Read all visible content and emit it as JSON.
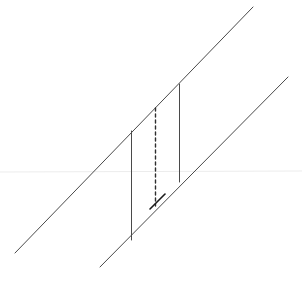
{
  "canvas": {
    "width": 302,
    "height": 286,
    "background_color": "#ffffff",
    "title": "Geometric line diagram"
  },
  "palette": {
    "stroke_dark": "#3a3a3a",
    "stroke_medium": "#555555",
    "stroke_faint": "#ececec",
    "background": "#ffffff"
  },
  "figure": {
    "horizon_line": {
      "name": "horizon-line",
      "x1": 0,
      "y1": 172,
      "x2": 302,
      "y2": 171,
      "color": "#ececec",
      "width": 1,
      "style": "solid"
    },
    "diagonals": [
      {
        "name": "upper-diagonal",
        "label": "Upper parallel line",
        "x1": 15,
        "y1": 253,
        "x2": 253,
        "y2": 7,
        "color": "#4a4a4a",
        "width": 1,
        "style": "solid"
      },
      {
        "name": "lower-diagonal",
        "label": "Lower parallel line",
        "x1": 100,
        "y1": 267,
        "x2": 288,
        "y2": 77,
        "color": "#4a4a4a",
        "width": 1,
        "style": "solid"
      }
    ],
    "verticals": [
      {
        "name": "left-vertical",
        "label": "Left solid vertical segment",
        "x": 131.5,
        "y1": 131,
        "y2": 240,
        "length": 109,
        "color": "#4a4a4a",
        "width": 1,
        "style": "solid"
      },
      {
        "name": "middle-vertical-dashed",
        "label": "Middle dashed vertical segment",
        "x": 155.5,
        "y1": 108,
        "y2": 206,
        "length": 98,
        "color": "#2e2e2e",
        "width": 1.4,
        "style": "dashed",
        "dash_pattern": "3 3"
      },
      {
        "name": "right-vertical",
        "label": "Right solid vertical segment",
        "x": 179.5,
        "y1": 84,
        "y2": 182,
        "length": 98,
        "color": "#4a4a4a",
        "width": 1,
        "style": "solid"
      }
    ],
    "accent_segment": {
      "name": "accent-segment",
      "label": "Short dark segment along lower diagonal near dashed base",
      "x1": 150,
      "y1": 209,
      "x2": 165,
      "y2": 194,
      "color": "#1a1a1a",
      "width": 1.6,
      "style": "solid"
    },
    "vertices": [
      {
        "name": "vertex-upper-left",
        "x": 131,
        "y": 131
      },
      {
        "name": "vertex-upper-mid",
        "x": 155,
        "y": 108
      },
      {
        "name": "vertex-upper-right",
        "x": 179,
        "y": 84
      },
      {
        "name": "vertex-lower-left",
        "x": 131,
        "y": 240
      },
      {
        "name": "vertex-lower-mid",
        "x": 155,
        "y": 206
      },
      {
        "name": "vertex-lower-right",
        "x": 179,
        "y": 182
      }
    ]
  }
}
